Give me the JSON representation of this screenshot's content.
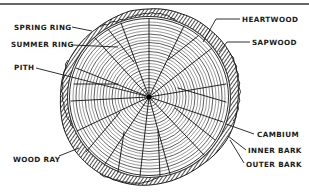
{
  "diagram": {
    "colors": {
      "ink": "#1a1a1a",
      "background": "#ffffff",
      "bark": "#2b2b2b"
    },
    "labels": {
      "spring_ring": "SPRING RING",
      "summer_ring": "SUMMER RING",
      "pith": "PITH",
      "wood_ray": "WOOD RAY",
      "heartwood": "HEARTWOOD",
      "sapwood": "SAPWOOD",
      "cambium": "CAMBIUM",
      "inner_bark": "INNER BARK",
      "outer_bark": "OUTER BARK"
    }
  }
}
